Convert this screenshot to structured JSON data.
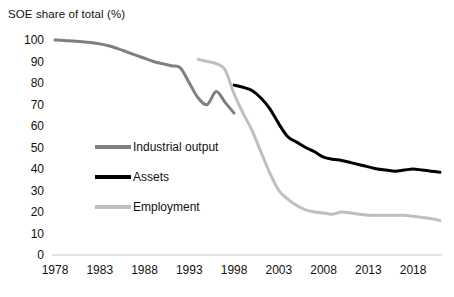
{
  "chart_data": {
    "type": "line",
    "title": "SOE share of total (%)",
    "xlabel": "",
    "ylabel": "SOE share of total (%)",
    "xlim": [
      1978,
      2021
    ],
    "ylim": [
      0,
      100
    ],
    "ytick_step": 10,
    "xtick_step": 5,
    "grid": false,
    "legend_position": "inside-left-middle",
    "yticks": [
      "100",
      "90",
      "80",
      "70",
      "60",
      "50",
      "40",
      "30",
      "20",
      "10",
      "0"
    ],
    "xticks": [
      "1978",
      "1983",
      "1988",
      "1993",
      "1998",
      "2003",
      "2008",
      "2013",
      "2018"
    ],
    "series": [
      {
        "name": "Industrial output",
        "color": "#7f7f7f",
        "x": [
          1978,
          1979,
          1980,
          1981,
          1982,
          1983,
          1984,
          1985,
          1986,
          1987,
          1988,
          1989,
          1990,
          1991,
          1992,
          1993,
          1994,
          1995,
          1996,
          1997,
          1998
        ],
        "values": [
          100,
          99.8,
          99.5,
          99.2,
          98.8,
          98.2,
          97.3,
          96,
          94.5,
          93,
          91.5,
          90,
          89,
          88,
          87,
          80,
          73,
          70,
          76,
          71,
          66
        ]
      },
      {
        "name": "Assets",
        "color": "#000000",
        "x": [
          1998,
          1999,
          2000,
          2001,
          2002,
          2003,
          2004,
          2005,
          2006,
          2007,
          2008,
          2009,
          2010,
          2011,
          2012,
          2013,
          2014,
          2015,
          2016,
          2017,
          2018,
          2019,
          2020,
          2021
        ],
        "values": [
          79,
          78,
          76.5,
          73,
          68,
          61,
          55,
          52.5,
          50,
          48,
          45.5,
          44.5,
          44,
          43,
          42,
          41,
          40,
          39.5,
          39,
          39.5,
          40,
          39.5,
          39,
          38.5
        ]
      },
      {
        "name": "Employment",
        "color": "#bfbfbf",
        "x": [
          1994,
          1995,
          1996,
          1997,
          1998,
          1999,
          2000,
          2001,
          2002,
          2003,
          2004,
          2005,
          2006,
          2007,
          2008,
          2009,
          2010,
          2011,
          2012,
          2013,
          2014,
          2015,
          2016,
          2017,
          2018,
          2019,
          2020,
          2021
        ],
        "values": [
          91,
          90,
          89,
          86,
          75,
          66,
          58,
          48,
          38,
          30,
          26,
          23,
          21,
          20,
          19.5,
          19,
          20,
          19.5,
          19,
          18.5,
          18.5,
          18.5,
          18.5,
          18.5,
          18,
          17.5,
          17,
          16
        ]
      }
    ]
  },
  "legend": {
    "items": [
      {
        "label": "Industrial output",
        "color": "#7f7f7f"
      },
      {
        "label": "Assets",
        "color": "#000000"
      },
      {
        "label": "Employment",
        "color": "#bfbfbf"
      }
    ]
  },
  "axis": {
    "baseline_color": "#d9d9d9"
  }
}
